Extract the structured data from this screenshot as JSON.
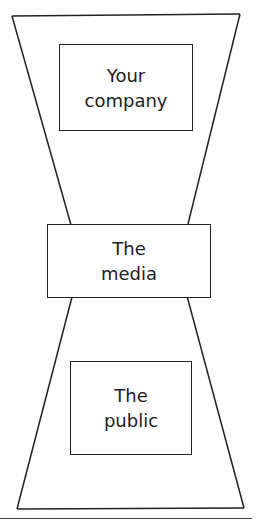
{
  "diagram": {
    "type": "hourglass",
    "boxes": [
      {
        "id": "company",
        "label": "Your\ncompany"
      },
      {
        "id": "media",
        "label": "The\nmedia"
      },
      {
        "id": "public",
        "label": "The\npublic"
      }
    ],
    "colors": {
      "stroke": "#222222",
      "text": "#222222",
      "background": "#ffffff"
    }
  }
}
